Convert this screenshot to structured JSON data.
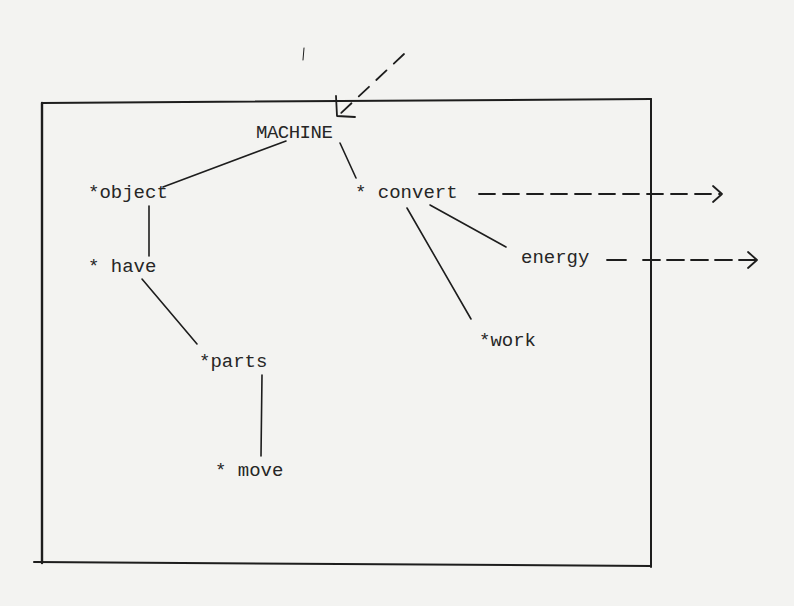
{
  "diagram": {
    "title_node": "MACHINE",
    "nodes": {
      "machine": {
        "label": "MACHINE",
        "x": 256,
        "y": 138
      },
      "object": {
        "label": "*object",
        "x": 88,
        "y": 198
      },
      "have": {
        "label": "* have",
        "x": 88,
        "y": 272
      },
      "parts": {
        "label": "*parts",
        "x": 199,
        "y": 367
      },
      "move": {
        "label": "* move",
        "x": 215,
        "y": 476
      },
      "convert": {
        "label": "* convert",
        "x": 355,
        "y": 198
      },
      "energy": {
        "label": "energy",
        "x": 521,
        "y": 263
      },
      "work": {
        "label": "*work",
        "x": 479,
        "y": 346
      }
    },
    "edges": [
      {
        "from": "machine",
        "to": "object",
        "style": "solid"
      },
      {
        "from": "machine",
        "to": "convert",
        "style": "solid"
      },
      {
        "from": "object",
        "to": "have",
        "style": "solid"
      },
      {
        "from": "have",
        "to": "parts",
        "style": "solid"
      },
      {
        "from": "parts",
        "to": "move",
        "style": "solid"
      },
      {
        "from": "convert",
        "to": "energy",
        "style": "solid"
      },
      {
        "from": "convert",
        "to": "work",
        "style": "solid"
      },
      {
        "from": "external",
        "to": "machine",
        "style": "dashed-arrow",
        "direction": "incoming"
      },
      {
        "from": "convert",
        "to": "outside",
        "style": "dashed-arrow",
        "direction": "outgoing"
      },
      {
        "from": "energy",
        "to": "outside",
        "style": "dashed-arrow",
        "direction": "outgoing"
      }
    ],
    "frame": {
      "left": 42,
      "top": 101,
      "right": 651,
      "bottom": 565
    },
    "colors": {
      "ink": "#1d1d1d",
      "paper": "#f3f3f1"
    }
  }
}
